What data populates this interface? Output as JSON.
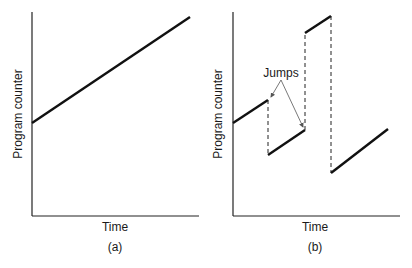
{
  "panels": [
    {
      "id": "a",
      "caption": "(a)",
      "xlabel": "Time",
      "ylabel": "Program counter"
    },
    {
      "id": "b",
      "caption": "(b)",
      "xlabel": "Time",
      "ylabel": "Program counter",
      "annotation": "Jumps"
    }
  ],
  "colors": {
    "line": "#111111",
    "arrow": "#555555"
  }
}
